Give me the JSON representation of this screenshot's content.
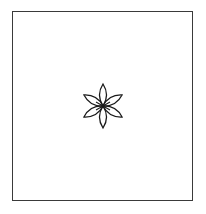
{
  "figure": {
    "frame": {
      "stroke_color": "#3a3a3a"
    },
    "symbol": {
      "icon": "six-petal-flower-icon",
      "petal_count": 6,
      "stroke_color": "#1a1a1a",
      "center": [
        103,
        106
      ]
    }
  }
}
